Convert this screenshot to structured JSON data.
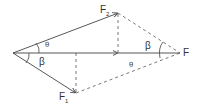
{
  "diagram": {
    "type": "force-parallelogram",
    "colors": {
      "stroke": "#444444",
      "background": "#ffffff"
    },
    "points": {
      "origin": [
        13,
        53
      ],
      "F2_tip": [
        118,
        13
      ],
      "F_point": [
        180,
        53
      ],
      "F1_tip": [
        76,
        93
      ],
      "axis_arrow_tip": [
        118,
        53
      ],
      "F1_foot": [
        76,
        53
      ]
    },
    "labels": {
      "F2": {
        "main": "F",
        "sub": "2"
      },
      "F1": {
        "main": "F",
        "sub": "1"
      },
      "F": "F",
      "beta_left": "β",
      "beta_right": "β",
      "theta_upper": "θ",
      "theta_lower": "θ"
    }
  }
}
